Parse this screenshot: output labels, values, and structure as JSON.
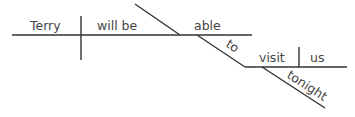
{
  "diagram": {
    "type": "sentence-diagram",
    "words": {
      "subject": "Terry",
      "verb": "will be",
      "predicate_adjective": "able",
      "infinitive_marker": "to",
      "infinitive_verb": "visit",
      "object": "us",
      "adverb": "tonight"
    },
    "colors": {
      "line": "#333333",
      "text": "#444444",
      "background": "#ffffff"
    }
  }
}
